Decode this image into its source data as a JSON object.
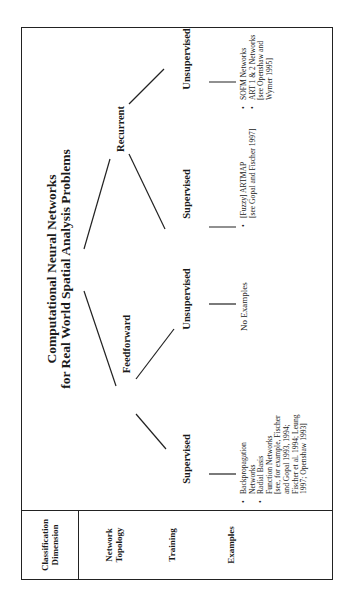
{
  "diagram": {
    "title_line1": "Computational Neural Networks",
    "title_line2": "for Real World Spatial Analysis Problems",
    "classification_header": {
      "line1": "Classification",
      "line2": "Dimension"
    },
    "row_labels": {
      "topology_line1": "Network",
      "topology_line2": "Topology",
      "training": "Training",
      "examples": "Examples"
    },
    "topology": {
      "feedforward": "Feedforward",
      "recurrent": "Recurrent"
    },
    "training": {
      "ff_supervised": "Supervised",
      "ff_unsupervised": "Unsupervised",
      "rec_supervised": "Supervised",
      "rec_unsupervised": "Unsupervised"
    },
    "examples": {
      "ff_supervised": {
        "bullet": "•",
        "item1_line1": "Backpropagation",
        "item1_line2": "Networks",
        "item2_line1": "Radial Basis",
        "item2_line2": "Function Networks",
        "item2_line3": "[see, for example, Fischer",
        "item2_line4": "and Gopal 1993, 1994;",
        "item2_line5": "Fischer et al. 1994; Leung",
        "item2_line6": "1997; Openshaw 1993]"
      },
      "ff_unsupervised": {
        "text": "No Examples"
      },
      "rec_supervised": {
        "bullet": "•",
        "item1_line1": "[Fuzzy] ARTMAP",
        "item1_line2": "[see Gopal and Fischer 1997]"
      },
      "rec_unsupervised": {
        "bullet": "•",
        "item1_line1": "SOFM Networks",
        "item2_line1": "ART 1 & 2 Networks",
        "item2_line2": "[see Openshaw and",
        "item2_line3": "Wymer 1995]"
      }
    }
  }
}
